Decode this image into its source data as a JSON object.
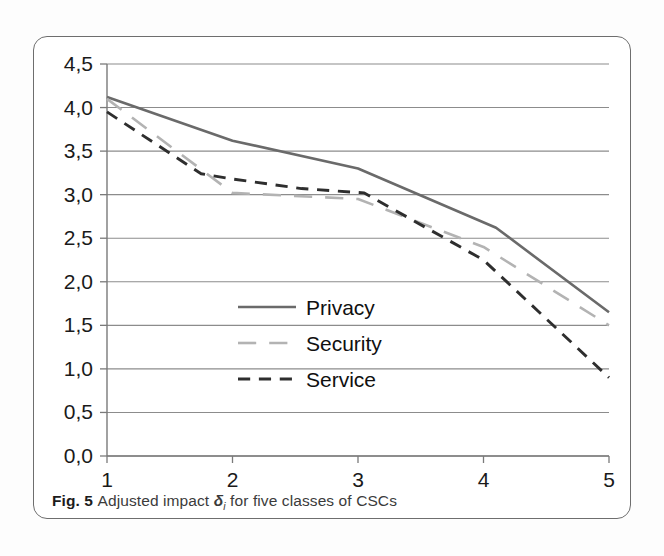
{
  "figure": {
    "caption_prefix": "Fig. 5",
    "caption_text_before": "Adjusted impact ",
    "caption_symbol": "δ",
    "caption_symbol_sub": "i",
    "caption_text_after": " for five classes of CSCs"
  },
  "chart_data": {
    "type": "line",
    "title": "",
    "xlabel": "",
    "ylabel": "",
    "x": [
      1,
      2,
      3,
      4,
      5
    ],
    "categories": [
      "1",
      "2",
      "3",
      "4",
      "5"
    ],
    "xtick_labels": [
      "1",
      "2",
      "3",
      "4",
      "5"
    ],
    "ytick_labels": [
      "0,0",
      "0,5",
      "1,0",
      "1,5",
      "2,0",
      "2,5",
      "3,0",
      "3,5",
      "4,0",
      "4,5"
    ],
    "ytick_values": [
      0.0,
      0.5,
      1.0,
      1.5,
      2.0,
      2.5,
      3.0,
      3.5,
      4.0,
      4.5
    ],
    "xlim": [
      1,
      5
    ],
    "ylim": [
      0.0,
      4.5
    ],
    "grid": true,
    "legend_position": "center",
    "series": [
      {
        "name": "Privacy",
        "values": [
          4.12,
          3.62,
          3.3,
          2.65,
          1.65
        ],
        "style": "solid",
        "color": "#6a6a6a",
        "width": 2.6,
        "knots_x": [
          1,
          2,
          3,
          4.1,
          5
        ],
        "knots_y": [
          4.12,
          3.62,
          3.3,
          2.62,
          1.65
        ]
      },
      {
        "name": "Security",
        "values": [
          4.1,
          3.02,
          2.95,
          2.4,
          1.5
        ],
        "style": "long-dash",
        "color": "#b3b3b3",
        "width": 2.6,
        "knots_x": [
          1,
          2,
          3,
          4,
          5
        ],
        "knots_y": [
          4.1,
          3.02,
          2.95,
          2.4,
          1.5
        ]
      },
      {
        "name": "Service",
        "values": [
          3.95,
          3.18,
          3.02,
          2.25,
          0.9
        ],
        "style": "short-dash",
        "color": "#2e2e2e",
        "width": 2.9,
        "knots_x": [
          1,
          1.75,
          2,
          2.55,
          3.05,
          4,
          5
        ],
        "knots_y": [
          3.95,
          3.24,
          3.18,
          3.07,
          3.02,
          2.25,
          0.9
        ]
      }
    ],
    "legend_entries": [
      {
        "label": "Privacy",
        "style": "solid",
        "color": "#6a6a6a"
      },
      {
        "label": "Security",
        "style": "long-dash",
        "color": "#b3b3b3"
      },
      {
        "label": "Service",
        "style": "short-dash",
        "color": "#2e2e2e"
      }
    ]
  }
}
